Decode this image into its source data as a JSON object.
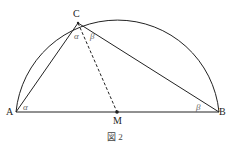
{
  "figure": {
    "caption": "図 2",
    "points": {
      "A": "A",
      "B": "B",
      "C": "C",
      "M": "M"
    },
    "angles": {
      "at_A": "α",
      "at_C_left": "α",
      "at_C_right": "β",
      "at_B": "β"
    },
    "top_right_fragment": "…"
  },
  "colors": {
    "stroke": "#222222",
    "angle_label": "#666666"
  }
}
